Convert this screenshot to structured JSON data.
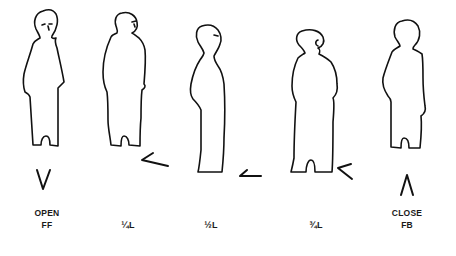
{
  "diagram": {
    "type": "body-position-figures",
    "positions": [
      {
        "id": "open",
        "line1": "OPEN",
        "line2": "FF",
        "marker": "V",
        "marker_direction": "down",
        "center_x": 47
      },
      {
        "id": "quarter-left",
        "line1": "",
        "line2": "¼L",
        "marker": "V",
        "marker_direction": "right-rotated",
        "center_x": 127
      },
      {
        "id": "half-left",
        "line1": "",
        "line2": "½L",
        "marker": "V",
        "marker_direction": "right",
        "center_x": 211
      },
      {
        "id": "three-quarter-left",
        "line1": "",
        "line2": "¾L",
        "marker": "V",
        "marker_direction": "up-right",
        "center_x": 308
      },
      {
        "id": "close",
        "line1": "CLOSE",
        "line2": "FB",
        "marker": "Λ",
        "marker_direction": "up",
        "center_x": 407
      }
    ],
    "colors": {
      "ink": "#111111",
      "background": "#ffffff"
    }
  }
}
